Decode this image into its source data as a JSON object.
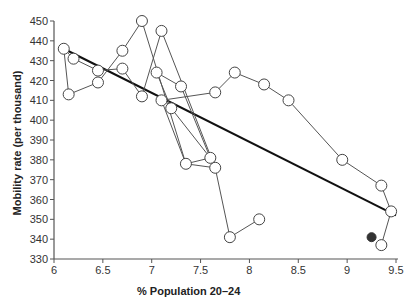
{
  "chart_data": {
    "type": "scatter",
    "title": "",
    "xlabel": "% Population 20–24",
    "ylabel": "Mobility rate (per thousand)",
    "xlim": [
      6,
      9.5
    ],
    "ylim": [
      330,
      450
    ],
    "x_ticks": [
      6,
      6.5,
      7,
      7.5,
      8,
      8.5,
      9,
      9.5
    ],
    "x_tick_labels": [
      "6",
      "6.5",
      "7",
      "7.5",
      "8",
      "8.5",
      "9",
      "9.5"
    ],
    "y_ticks": [
      330,
      340,
      350,
      360,
      370,
      380,
      390,
      400,
      410,
      420,
      430,
      440,
      450
    ],
    "y_tick_labels": [
      "330",
      "340",
      "350",
      "360",
      "370",
      "380",
      "390",
      "400",
      "410",
      "420",
      "430",
      "440",
      "450"
    ],
    "grid": false,
    "legend": null,
    "series": [
      {
        "name": "Yearly observations (connected)",
        "marker": "open-circle",
        "connected": true,
        "points": [
          [
            8.1,
            350
          ],
          [
            7.8,
            341
          ],
          [
            7.65,
            376
          ],
          [
            7.1,
            445
          ],
          [
            6.9,
            412
          ],
          [
            6.7,
            426
          ],
          [
            6.45,
            425
          ],
          [
            6.2,
            431
          ],
          [
            6.1,
            436
          ],
          [
            6.15,
            413
          ],
          [
            6.45,
            419
          ],
          [
            6.7,
            435
          ],
          [
            6.9,
            450
          ],
          [
            7.35,
            378
          ],
          [
            7.6,
            381
          ],
          [
            7.2,
            406
          ],
          [
            7.05,
            424
          ],
          [
            7.3,
            417
          ],
          [
            7.6,
            381
          ],
          [
            7.65,
            376
          ],
          [
            7.35,
            378
          ],
          [
            7.1,
            410
          ],
          [
            7.65,
            414
          ],
          [
            7.85,
            424
          ],
          [
            8.15,
            418
          ],
          [
            8.4,
            410
          ],
          [
            8.95,
            380
          ],
          [
            9.35,
            367
          ],
          [
            9.45,
            354
          ],
          [
            9.35,
            337
          ]
        ]
      },
      {
        "name": "Highlighted observation",
        "marker": "filled-circle",
        "connected": false,
        "points": [
          [
            9.25,
            341
          ]
        ]
      },
      {
        "name": "Regression line",
        "type": "line",
        "points": [
          [
            6.1,
            436
          ],
          [
            9.5,
            352
          ]
        ]
      }
    ]
  }
}
